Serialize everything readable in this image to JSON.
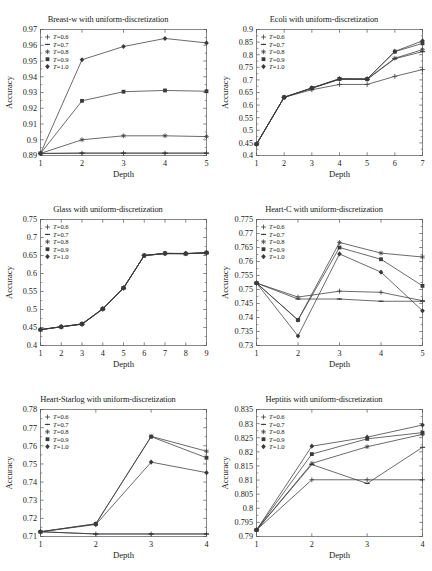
{
  "figure": {
    "axis_label_y": "Accuracy",
    "axis_label_x": "Depth",
    "legend_labels": [
      "T=0.6",
      "T=0.7",
      "T=0.8",
      "T=0.9",
      "T=1.0"
    ],
    "legend_markers": [
      "plus",
      "dash-dot",
      "star",
      "square",
      "filled-diamond"
    ],
    "line_color": "#3a3a3a",
    "axis_color": "#555555",
    "background": "#ffffff"
  },
  "chart_data": [
    {
      "type": "line",
      "title": "Breast-w with uniform-discretization",
      "xlabel": "Depth",
      "ylabel": "Accuracy",
      "x": [
        1,
        2,
        3,
        4,
        5
      ],
      "xlim": [
        1,
        5
      ],
      "xticks": [
        1,
        2,
        3,
        4,
        5
      ],
      "ylim": [
        0.89,
        0.97
      ],
      "yticks": [
        0.89,
        0.9,
        0.91,
        0.92,
        0.93,
        0.94,
        0.95,
        0.96,
        0.97
      ],
      "ytick_labels": [
        "0.89",
        "0.9",
        "0.91",
        "0.92",
        "0.93",
        "0.94",
        "0.95",
        "0.96",
        "0.97"
      ],
      "grid": false,
      "legend_position": "top-left",
      "series": [
        {
          "name": "T=0.6",
          "values": [
            0.8913,
            0.8915,
            0.8915,
            0.8915,
            0.8915
          ]
        },
        {
          "name": "T=0.7",
          "values": [
            0.8913,
            0.8915,
            0.8915,
            0.8915,
            0.8915
          ]
        },
        {
          "name": "T=0.8",
          "values": [
            0.8913,
            0.9,
            0.9025,
            0.9025,
            0.902
          ]
        },
        {
          "name": "T=0.9",
          "values": [
            0.8913,
            0.9247,
            0.9305,
            0.9313,
            0.9308
          ]
        },
        {
          "name": "T=1.0",
          "values": [
            0.8913,
            0.9508,
            0.9592,
            0.9643,
            0.9615
          ]
        }
      ]
    },
    {
      "type": "line",
      "title": "Ecoli with uniform-discretization",
      "xlabel": "Depth",
      "ylabel": "Accuracy",
      "x": [
        1,
        2,
        3,
        4,
        5,
        6,
        7
      ],
      "xlim": [
        1,
        7
      ],
      "xticks": [
        1,
        2,
        3,
        4,
        5,
        6,
        7
      ],
      "ylim": [
        0.4,
        0.9
      ],
      "yticks": [
        0.4,
        0.45,
        0.5,
        0.55,
        0.6,
        0.65,
        0.7,
        0.75,
        0.8,
        0.85,
        0.9
      ],
      "ytick_labels": [
        "0.4",
        "0.45",
        "0.5",
        "0.55",
        "0.6",
        "0.65",
        "0.7",
        "0.75",
        "0.8",
        "0.85",
        "0.9"
      ],
      "grid": false,
      "legend_position": "top-left",
      "series": [
        {
          "name": "T=0.6",
          "values": [
            0.445,
            0.631,
            0.661,
            0.682,
            0.682,
            0.714,
            0.741
          ]
        },
        {
          "name": "T=0.7",
          "values": [
            0.445,
            0.631,
            0.667,
            0.702,
            0.702,
            0.784,
            0.812
          ]
        },
        {
          "name": "T=0.8",
          "values": [
            0.445,
            0.631,
            0.667,
            0.703,
            0.703,
            0.786,
            0.82
          ]
        },
        {
          "name": "T=0.9",
          "values": [
            0.445,
            0.631,
            0.668,
            0.704,
            0.703,
            0.812,
            0.845
          ]
        },
        {
          "name": "T=1.0",
          "values": [
            0.445,
            0.631,
            0.668,
            0.705,
            0.704,
            0.813,
            0.855
          ]
        }
      ]
    },
    {
      "type": "line",
      "title": "Glass with uniform-discretization",
      "xlabel": "Depth",
      "ylabel": "Accuracy",
      "x": [
        1,
        2,
        3,
        4,
        5,
        6,
        7,
        8,
        9
      ],
      "xlim": [
        1,
        9
      ],
      "xticks": [
        1,
        2,
        3,
        4,
        5,
        6,
        7,
        8,
        9
      ],
      "ylim": [
        0.4,
        0.75
      ],
      "yticks": [
        0.4,
        0.45,
        0.5,
        0.55,
        0.6,
        0.65,
        0.7,
        0.75
      ],
      "ytick_labels": [
        "0.4",
        "0.45",
        "0.5",
        "0.55",
        "0.6",
        "0.65",
        "0.7",
        "0.75"
      ],
      "grid": false,
      "legend_position": "top-left",
      "series": [
        {
          "name": "T=0.6",
          "values": [
            0.444,
            0.452,
            0.459,
            0.501,
            0.559,
            0.65,
            0.655,
            0.655,
            0.657
          ]
        },
        {
          "name": "T=0.7",
          "values": [
            0.444,
            0.452,
            0.459,
            0.501,
            0.559,
            0.65,
            0.655,
            0.655,
            0.657
          ]
        },
        {
          "name": "T=0.8",
          "values": [
            0.444,
            0.452,
            0.46,
            0.502,
            0.56,
            0.65,
            0.656,
            0.655,
            0.657
          ]
        },
        {
          "name": "T=0.9",
          "values": [
            0.444,
            0.452,
            0.46,
            0.502,
            0.56,
            0.65,
            0.656,
            0.655,
            0.658
          ]
        },
        {
          "name": "T=1.0",
          "values": [
            0.444,
            0.452,
            0.46,
            0.502,
            0.56,
            0.65,
            0.656,
            0.656,
            0.658
          ]
        }
      ]
    },
    {
      "type": "line",
      "title": "Heart-C with uniform-discretization",
      "xlabel": "Depth",
      "ylabel": "Accuracy",
      "x": [
        1,
        2,
        3,
        4,
        5
      ],
      "xlim": [
        1,
        5
      ],
      "xticks": [
        1,
        2,
        3,
        4,
        5
      ],
      "ylim": [
        0.73,
        0.775
      ],
      "yticks": [
        0.73,
        0.735,
        0.74,
        0.745,
        0.75,
        0.755,
        0.76,
        0.765,
        0.77,
        0.775
      ],
      "ytick_labels": [
        "0.73",
        "0.735",
        "0.74",
        "0.745",
        "0.75",
        "0.755",
        "0.76",
        "0.765",
        "0.77",
        "0.775"
      ],
      "grid": false,
      "legend_position": "top-left",
      "series": [
        {
          "name": "T=0.6",
          "values": [
            0.7523,
            0.7473,
            0.7494,
            0.749,
            0.746
          ]
        },
        {
          "name": "T=0.7",
          "values": [
            0.7523,
            0.7466,
            0.7466,
            0.7458,
            0.7458
          ]
        },
        {
          "name": "T=0.8",
          "values": [
            0.7523,
            0.7391,
            0.7668,
            0.763,
            0.7616
          ]
        },
        {
          "name": "T=0.9",
          "values": [
            0.7523,
            0.7391,
            0.765,
            0.7608,
            0.7513
          ]
        },
        {
          "name": "T=1.0",
          "values": [
            0.7523,
            0.7334,
            0.7627,
            0.7562,
            0.7424
          ]
        }
      ]
    },
    {
      "type": "line",
      "title": "Heart-Starlog with uniform-discretization",
      "xlabel": "Depth",
      "ylabel": "Accuracy",
      "x": [
        1,
        2,
        3,
        4
      ],
      "xlim": [
        1,
        4
      ],
      "xticks": [
        1,
        2,
        3,
        4
      ],
      "ylim": [
        0.71,
        0.78
      ],
      "yticks": [
        0.71,
        0.72,
        0.73,
        0.74,
        0.75,
        0.76,
        0.77,
        0.78
      ],
      "ytick_labels": [
        "0.71",
        "0.72",
        "0.73",
        "0.74",
        "0.75",
        "0.76",
        "0.77",
        "0.78"
      ],
      "grid": false,
      "legend_position": "top-left",
      "series": [
        {
          "name": "T=0.6",
          "values": [
            0.7126,
            0.7114,
            0.7114,
            0.7114
          ]
        },
        {
          "name": "T=0.7",
          "values": [
            0.7126,
            0.7114,
            0.7114,
            0.7114
          ]
        },
        {
          "name": "T=0.8",
          "values": [
            0.7126,
            0.717,
            0.7652,
            0.757
          ]
        },
        {
          "name": "T=0.9",
          "values": [
            0.7126,
            0.717,
            0.765,
            0.7534
          ]
        },
        {
          "name": "T=1.0",
          "values": [
            0.7126,
            0.7166,
            0.751,
            0.7452
          ]
        }
      ]
    },
    {
      "type": "line",
      "title": "Heptitis with uniform-discretization",
      "xlabel": "Depth",
      "ylabel": "Accuracy",
      "x": [
        1,
        2,
        3,
        4
      ],
      "xlim": [
        1,
        4
      ],
      "xticks": [
        1,
        2,
        3,
        4
      ],
      "ylim": [
        0.79,
        0.835
      ],
      "yticks": [
        0.79,
        0.795,
        0.8,
        0.805,
        0.81,
        0.815,
        0.82,
        0.825,
        0.83,
        0.835
      ],
      "ytick_labels": [
        "0.79",
        "0.795",
        "0.8",
        "0.805",
        "0.81",
        "0.815",
        "0.82",
        "0.825",
        "0.83",
        "0.835"
      ],
      "grid": false,
      "legend_position": "top-left",
      "series": [
        {
          "name": "T=0.6",
          "values": [
            0.7923,
            0.8101,
            0.8101,
            0.8101
          ]
        },
        {
          "name": "T=0.7",
          "values": [
            0.7923,
            0.8155,
            0.8088,
            0.8216
          ]
        },
        {
          "name": "T=0.8",
          "values": [
            0.7923,
            0.8159,
            0.8218,
            0.8262
          ]
        },
        {
          "name": "T=0.9",
          "values": [
            0.7923,
            0.8192,
            0.8246,
            0.8268
          ]
        },
        {
          "name": "T=1.0",
          "values": [
            0.7923,
            0.822,
            0.8252,
            0.8295
          ]
        }
      ]
    }
  ]
}
